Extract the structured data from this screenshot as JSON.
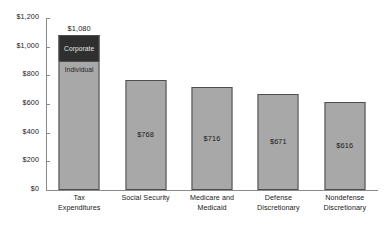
{
  "chart_data": {
    "type": "bar",
    "title": "",
    "xlabel": "",
    "ylabel": "",
    "ylim": [
      0,
      1200
    ],
    "ytick_step": 200,
    "grid": false,
    "legend": "none",
    "value_prefix": "$",
    "categories": [
      "Tax Expenditures",
      "Social Security",
      "Medicare and Medicaid",
      "Defense Discretionary",
      "Nondefense Discretionary"
    ],
    "values": [
      1080,
      768,
      716,
      671,
      616
    ],
    "y_ticks": [
      "$0",
      "$200",
      "$400",
      "$600",
      "$800",
      "$1,000",
      "$1,200"
    ],
    "y_tick_values": [
      0,
      200,
      400,
      600,
      800,
      1000,
      1200
    ],
    "bars": [
      {
        "category_lines": [
          "Tax",
          "Expenditures"
        ],
        "total": 1080,
        "label": "$1,080",
        "label_position": "above",
        "stacked": true,
        "segments": [
          {
            "name": "Corporate",
            "value": 180,
            "color": "#2f2f2f",
            "text_color": "#e8e8e8"
          },
          {
            "name": "Individual",
            "value": 900,
            "color": "#a8a8a8",
            "text_color": "#1f1f1f"
          }
        ]
      },
      {
        "category_lines": [
          "Social Security"
        ],
        "total": 768,
        "label": "$768",
        "label_position": "inside",
        "stacked": false,
        "segments": []
      },
      {
        "category_lines": [
          "Medicare and",
          "Medicaid"
        ],
        "total": 716,
        "label": "$716",
        "label_position": "inside",
        "stacked": false,
        "segments": []
      },
      {
        "category_lines": [
          "Defense",
          "Discretionary"
        ],
        "total": 671,
        "label": "$671",
        "label_position": "inside",
        "stacked": false,
        "segments": []
      },
      {
        "category_lines": [
          "Nondefense",
          "Discretionary"
        ],
        "total": 616,
        "label": "$616",
        "label_position": "inside",
        "stacked": false,
        "segments": []
      }
    ],
    "colors": {
      "bar_fill": "#a8a8a8",
      "bar_border": "#4d4d4d",
      "stack_top_fill": "#2f2f2f",
      "axis": "#8a8a8a",
      "text": "#1a1a1a",
      "background": "#ffffff"
    }
  }
}
